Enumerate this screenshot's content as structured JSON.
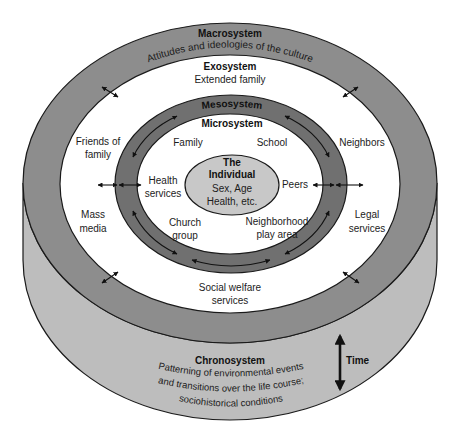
{
  "diagram": {
    "colors": {
      "macrosystem_band": "#8d8d8d",
      "chronosystem_side": "#bdbdbd",
      "exosystem_fill": "#ffffff",
      "mesosystem_band": "#707070",
      "microsystem_fill": "#ffffff",
      "individual_fill": "#c8c8c8",
      "outline": "#1a1a1a"
    },
    "macrosystem": {
      "title": "Macrosystem",
      "description": "Attitudes and ideologies of the culture"
    },
    "exosystem": {
      "title": "Exosystem",
      "items": [
        {
          "lines": [
            "Extended family"
          ]
        },
        {
          "lines": [
            "Friends of",
            "family"
          ]
        },
        {
          "lines": [
            "Neighbors"
          ]
        },
        {
          "lines": [
            "Mass",
            "media"
          ]
        },
        {
          "lines": [
            "Legal",
            "services"
          ]
        },
        {
          "lines": [
            "Social welfare",
            "services"
          ]
        }
      ]
    },
    "mesosystem": {
      "title": "Mesosystem"
    },
    "microsystem": {
      "title": "Microsystem",
      "items": [
        {
          "lines": [
            "Family"
          ]
        },
        {
          "lines": [
            "School"
          ]
        },
        {
          "lines": [
            "Health",
            "services"
          ]
        },
        {
          "lines": [
            "Peers"
          ]
        },
        {
          "lines": [
            "Church",
            "group"
          ]
        },
        {
          "lines": [
            "Neighborhood",
            "play area"
          ]
        }
      ]
    },
    "individual": {
      "title_lines": [
        "The",
        "Individual"
      ],
      "attribute_lines": [
        "Sex, Age",
        "Health, etc."
      ]
    },
    "chronosystem": {
      "title": "Chronosystem",
      "description_lines": [
        "Patterning of environmental events",
        "and transitions over the life course;",
        "sociohistorical conditions"
      ],
      "time_label": "Time"
    }
  }
}
